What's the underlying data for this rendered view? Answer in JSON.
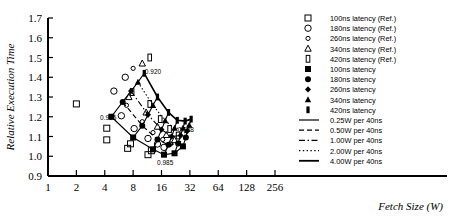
{
  "chart_data": {
    "type": "scatter",
    "title": "",
    "xlabel": "Fetch Size (W)",
    "ylabel": "Relative Execution Time",
    "xscale": "log2",
    "xlim": [
      1,
      256
    ],
    "ylim": [
      0.9,
      1.7
    ],
    "xticks": [
      1,
      2,
      4,
      8,
      16,
      32,
      64,
      128,
      256
    ],
    "xtick_labels": [
      "1",
      "2",
      "4",
      "8",
      "16",
      "32",
      "64",
      "128",
      "256"
    ],
    "yticks": [
      0.9,
      1.0,
      1.1,
      1.2,
      1.3,
      1.4,
      1.5,
      1.6,
      1.7
    ],
    "ytick_labels": [
      "0.9",
      "1.0",
      "1.1",
      "1.2",
      "1.3",
      "1.4",
      "1.5",
      "1.6",
      "1.7"
    ],
    "grid": false,
    "legend_position": "right",
    "annotations": [
      {
        "text": "0.920",
        "x": 13.0,
        "y": 1.415
      },
      {
        "text": "0.935",
        "x": 4.35,
        "y": 1.185
      },
      {
        "text": "0.988",
        "x": 29.0,
        "y": 1.125
      },
      {
        "text": "0.985",
        "x": 17.5,
        "y": 0.955
      }
    ],
    "reference_series": [
      {
        "name": "100ns latency (Ref.)",
        "marker": "open-square",
        "points": [
          [
            2.0,
            1.265
          ],
          [
            4.2,
            1.142
          ],
          [
            7.0,
            1.04
          ],
          [
            11.5,
            1.008
          ],
          [
            4.2,
            1.083
          ],
          [
            7.5,
            1.063
          ],
          [
            12.5,
            1.028
          ]
        ]
      },
      {
        "name": "180ns latency (Ref.)",
        "marker": "open-circle-large",
        "points": [
          [
            5.0,
            1.33
          ],
          [
            6.6,
            1.4
          ],
          [
            6.0,
            1.205
          ],
          [
            8.2,
            1.14
          ],
          [
            11.5,
            1.09
          ],
          [
            14.5,
            1.062
          ],
          [
            17.0,
            1.045
          ]
        ]
      },
      {
        "name": "260ns latency (Ref.)",
        "marker": "open-circle-small",
        "points": [
          [
            8.0,
            1.445
          ],
          [
            6.8,
            1.258
          ],
          [
            10.0,
            1.175
          ],
          [
            13.0,
            1.12
          ],
          [
            16.5,
            1.085
          ],
          [
            20.0,
            1.062
          ]
        ]
      },
      {
        "name": "340ns latency (Ref.)",
        "marker": "open-triangle",
        "points": [
          [
            10.0,
            1.47
          ],
          [
            7.2,
            1.3
          ],
          [
            11.0,
            1.222
          ],
          [
            14.5,
            1.15
          ],
          [
            18.0,
            1.108
          ],
          [
            22.0,
            1.082
          ]
        ]
      },
      {
        "name": "420ns latency (Ref.)",
        "marker": "open-bar",
        "points": [
          [
            12.0,
            1.5
          ],
          [
            7.8,
            1.325
          ],
          [
            12.0,
            1.265
          ],
          [
            15.5,
            1.188
          ],
          [
            19.5,
            1.138
          ],
          [
            24.0,
            1.105
          ]
        ]
      }
    ],
    "series": [
      {
        "name": "100ns latency",
        "marker": "filled-square",
        "linestyle": "solid-thin",
        "points": [
          [
            4.7,
            1.2
          ],
          [
            8.0,
            1.095
          ],
          [
            13.0,
            1.035
          ],
          [
            17.0,
            1.008
          ],
          [
            22.0,
            1.015
          ],
          [
            27.0,
            1.05
          ]
        ]
      },
      {
        "name": "180ns latency",
        "marker": "filled-circle",
        "linestyle": "dashed",
        "points": [
          [
            6.2,
            1.275
          ],
          [
            10.0,
            1.155
          ],
          [
            14.5,
            1.085
          ],
          [
            19.0,
            1.058
          ],
          [
            24.0,
            1.065
          ],
          [
            29.0,
            1.095
          ]
        ]
      },
      {
        "name": "260ns latency",
        "marker": "filled-diamond",
        "linestyle": "dash-dot",
        "points": [
          [
            7.6,
            1.33
          ],
          [
            11.5,
            1.21
          ],
          [
            16.0,
            1.135
          ],
          [
            20.5,
            1.1
          ],
          [
            25.5,
            1.105
          ],
          [
            30.0,
            1.128
          ]
        ]
      },
      {
        "name": "340ns latency",
        "marker": "filled-triangle",
        "linestyle": "dotted",
        "points": [
          [
            9.0,
            1.375
          ],
          [
            13.0,
            1.258
          ],
          [
            17.5,
            1.18
          ],
          [
            22.0,
            1.142
          ],
          [
            27.0,
            1.142
          ],
          [
            31.5,
            1.158
          ]
        ]
      },
      {
        "name": "420ns latency",
        "marker": "filled-bar",
        "linestyle": "solid-thick",
        "points": [
          [
            10.5,
            1.42
          ],
          [
            14.5,
            1.3
          ],
          [
            19.0,
            1.222
          ],
          [
            23.5,
            1.182
          ],
          [
            28.5,
            1.178
          ],
          [
            33.0,
            1.188
          ]
        ]
      }
    ],
    "connector_curves": [
      {
        "name": "0.25W per 40ns",
        "points": [
          [
            4.7,
            1.2
          ],
          [
            6.2,
            1.275
          ],
          [
            7.6,
            1.33
          ],
          [
            9.0,
            1.375
          ],
          [
            10.5,
            1.42
          ]
        ]
      },
      {
        "name": "0.50W per 40ns",
        "points": [
          [
            8.0,
            1.095
          ],
          [
            10.0,
            1.155
          ],
          [
            11.5,
            1.21
          ],
          [
            13.0,
            1.258
          ],
          [
            14.5,
            1.3
          ]
        ]
      },
      {
        "name": "1.00W per 40ns",
        "points": [
          [
            13.0,
            1.035
          ],
          [
            14.5,
            1.085
          ],
          [
            16.0,
            1.135
          ],
          [
            17.5,
            1.18
          ],
          [
            19.0,
            1.222
          ]
        ]
      },
      {
        "name": "2.00W per 40ns",
        "points": [
          [
            17.0,
            1.008
          ],
          [
            19.0,
            1.058
          ],
          [
            20.5,
            1.1
          ],
          [
            22.0,
            1.142
          ],
          [
            23.5,
            1.182
          ]
        ]
      },
      {
        "name": "4.00W per 40ns",
        "points": [
          [
            22.0,
            1.015
          ],
          [
            24.0,
            1.065
          ],
          [
            25.5,
            1.105
          ],
          [
            27.0,
            1.142
          ],
          [
            28.5,
            1.178
          ]
        ]
      },
      {
        "name": "tail",
        "points": [
          [
            27.0,
            1.05
          ],
          [
            29.0,
            1.095
          ],
          [
            30.0,
            1.128
          ],
          [
            31.5,
            1.158
          ],
          [
            33.0,
            1.188
          ]
        ]
      }
    ]
  },
  "legend": {
    "entries": [
      {
        "label": "100ns latency (Ref.)",
        "marker": "open-square"
      },
      {
        "label": "180ns latency (Ref.)",
        "marker": "open-circle-large"
      },
      {
        "label": "260ns latency (Ref.)",
        "marker": "open-circle-small"
      },
      {
        "label": "340ns latency (Ref.)",
        "marker": "open-triangle"
      },
      {
        "label": "420ns latency (Ref.)",
        "marker": "open-bar"
      },
      {
        "label": "100ns latency",
        "marker": "filled-square"
      },
      {
        "label": "180ns latency",
        "marker": "filled-circle"
      },
      {
        "label": "260ns latency",
        "marker": "filled-diamond"
      },
      {
        "label": "340ns latency",
        "marker": "filled-triangle"
      },
      {
        "label": "420ns latency",
        "marker": "filled-bar"
      },
      {
        "label": "0.25W per 40ns",
        "marker": "line-solid-thin"
      },
      {
        "label": "0.50W per 40ns",
        "marker": "line-dashed"
      },
      {
        "label": "1.00W per 40ns",
        "marker": "line-dash-dot"
      },
      {
        "label": "2.00W per 40ns",
        "marker": "line-dotted"
      },
      {
        "label": "4.00W per 40ns",
        "marker": "line-solid-thick"
      }
    ]
  },
  "colors": {
    "ink": "#000000",
    "background": "#ffffff"
  }
}
